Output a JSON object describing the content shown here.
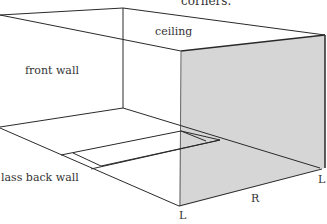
{
  "diagram": {
    "caption_fragment": "corners.",
    "labels": {
      "ceiling": "ceiling",
      "front_wall": "front wall",
      "back_wall": "lass back wall",
      "corner_left_bottom": "L",
      "corner_right_bottom": "L",
      "edge_floor_right": "R"
    },
    "colors": {
      "line": "#2a2a2a",
      "shaded_wall": "#d6d6d6",
      "background": "#ffffff"
    }
  }
}
